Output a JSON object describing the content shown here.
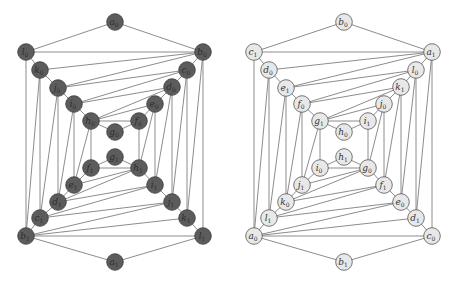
{
  "graphs": [
    {
      "name": "left-graph",
      "style": "dark",
      "colors": {
        "fill": "#5c5c5c",
        "stroke": "#3c3c3c",
        "text": "#2e2e2e"
      },
      "nodes": [
        {
          "id": "a0",
          "letter": "a",
          "sub": "0",
          "x": 115,
          "y": 22
        },
        {
          "id": "l0",
          "letter": "l",
          "sub": "0",
          "x": 26,
          "y": 52
        },
        {
          "id": "b0",
          "letter": "b",
          "sub": "0",
          "x": 203,
          "y": 52
        },
        {
          "id": "k0",
          "letter": "k",
          "sub": "0",
          "x": 40,
          "y": 70
        },
        {
          "id": "c0",
          "letter": "c",
          "sub": "0",
          "x": 187,
          "y": 70
        },
        {
          "id": "j0",
          "letter": "j",
          "sub": "0",
          "x": 58,
          "y": 88
        },
        {
          "id": "d0",
          "letter": "d",
          "sub": "0",
          "x": 172,
          "y": 87
        },
        {
          "id": "i0",
          "letter": "i",
          "sub": "0",
          "x": 74,
          "y": 104
        },
        {
          "id": "e0",
          "letter": "e",
          "sub": "0",
          "x": 155,
          "y": 104
        },
        {
          "id": "h0",
          "letter": "h",
          "sub": "0",
          "x": 91,
          "y": 121
        },
        {
          "id": "f0",
          "letter": "f",
          "sub": "0",
          "x": 139,
          "y": 121
        },
        {
          "id": "g0",
          "letter": "g",
          "sub": "0",
          "x": 115,
          "y": 132
        },
        {
          "id": "g1",
          "letter": "g",
          "sub": "1",
          "x": 115,
          "y": 157
        },
        {
          "id": "f1",
          "letter": "f",
          "sub": "1",
          "x": 91,
          "y": 168
        },
        {
          "id": "h1",
          "letter": "h",
          "sub": "1",
          "x": 139,
          "y": 168
        },
        {
          "id": "e1",
          "letter": "e",
          "sub": "1",
          "x": 74,
          "y": 185
        },
        {
          "id": "i1",
          "letter": "i",
          "sub": "1",
          "x": 155,
          "y": 185
        },
        {
          "id": "d1",
          "letter": "d",
          "sub": "1",
          "x": 58,
          "y": 202
        },
        {
          "id": "j1",
          "letter": "j",
          "sub": "1",
          "x": 172,
          "y": 202
        },
        {
          "id": "c1",
          "letter": "c",
          "sub": "1",
          "x": 40,
          "y": 218
        },
        {
          "id": "k1",
          "letter": "k",
          "sub": "1",
          "x": 187,
          "y": 218
        },
        {
          "id": "b1",
          "letter": "b",
          "sub": "1",
          "x": 26,
          "y": 236
        },
        {
          "id": "l1",
          "letter": "l",
          "sub": "1",
          "x": 203,
          "y": 236
        },
        {
          "id": "a1",
          "letter": "a",
          "sub": "1",
          "x": 115,
          "y": 262
        }
      ],
      "edges": [
        [
          "a0",
          "l0"
        ],
        [
          "a0",
          "b0"
        ],
        [
          "l0",
          "b0"
        ],
        [
          "l0",
          "k0"
        ],
        [
          "k0",
          "j0"
        ],
        [
          "j0",
          "i0"
        ],
        [
          "i0",
          "h0"
        ],
        [
          "h0",
          "g0"
        ],
        [
          "g0",
          "f0"
        ],
        [
          "f0",
          "e0"
        ],
        [
          "e0",
          "d0"
        ],
        [
          "d0",
          "c0"
        ],
        [
          "c0",
          "b0"
        ],
        [
          "b0",
          "k0"
        ],
        [
          "b0",
          "j0"
        ],
        [
          "c0",
          "j0"
        ],
        [
          "c0",
          "i0"
        ],
        [
          "d0",
          "i0"
        ],
        [
          "d0",
          "h0"
        ],
        [
          "e0",
          "h0"
        ],
        [
          "h0",
          "f0"
        ],
        [
          "a1",
          "b1"
        ],
        [
          "a1",
          "l1"
        ],
        [
          "b1",
          "l1"
        ],
        [
          "b1",
          "c1"
        ],
        [
          "c1",
          "d1"
        ],
        [
          "d1",
          "e1"
        ],
        [
          "e1",
          "f1"
        ],
        [
          "f1",
          "g1"
        ],
        [
          "g1",
          "h1"
        ],
        [
          "h1",
          "i1"
        ],
        [
          "i1",
          "j1"
        ],
        [
          "j1",
          "k1"
        ],
        [
          "k1",
          "l1"
        ],
        [
          "b1",
          "k1"
        ],
        [
          "b1",
          "j1"
        ],
        [
          "c1",
          "j1"
        ],
        [
          "c1",
          "i1"
        ],
        [
          "d1",
          "i1"
        ],
        [
          "d1",
          "h1"
        ],
        [
          "e1",
          "h1"
        ],
        [
          "f1",
          "h1"
        ],
        [
          "l0",
          "b1"
        ],
        [
          "k0",
          "b1"
        ],
        [
          "k0",
          "c1"
        ],
        [
          "j0",
          "c1"
        ],
        [
          "j0",
          "d1"
        ],
        [
          "i0",
          "d1"
        ],
        [
          "i0",
          "e1"
        ],
        [
          "h0",
          "e1"
        ],
        [
          "h0",
          "f1"
        ],
        [
          "b0",
          "l1"
        ],
        [
          "b0",
          "k1"
        ],
        [
          "c0",
          "k1"
        ],
        [
          "c0",
          "j1"
        ],
        [
          "d0",
          "j1"
        ],
        [
          "d0",
          "i1"
        ],
        [
          "e0",
          "i1"
        ],
        [
          "e0",
          "h1"
        ],
        [
          "f0",
          "h1"
        ]
      ]
    },
    {
      "name": "right-graph",
      "style": "light",
      "colors": {
        "fill": "#e8e8e8",
        "stroke": "#555555",
        "text": "#333333"
      },
      "nodes": [
        {
          "id": "b0",
          "letter": "b",
          "sub": "0",
          "x": 344,
          "y": 22
        },
        {
          "id": "c1",
          "letter": "c",
          "sub": "1",
          "x": 254,
          "y": 52
        },
        {
          "id": "a1",
          "letter": "a",
          "sub": "1",
          "x": 432,
          "y": 52
        },
        {
          "id": "d0",
          "letter": "d",
          "sub": "0",
          "x": 269,
          "y": 70
        },
        {
          "id": "l0",
          "letter": "l",
          "sub": "0",
          "x": 416,
          "y": 70
        },
        {
          "id": "e1",
          "letter": "e",
          "sub": "1",
          "x": 286,
          "y": 88
        },
        {
          "id": "k1",
          "letter": "k",
          "sub": "1",
          "x": 401,
          "y": 87
        },
        {
          "id": "f0",
          "letter": "f",
          "sub": "0",
          "x": 302,
          "y": 104
        },
        {
          "id": "j0",
          "letter": "j",
          "sub": "0",
          "x": 384,
          "y": 104
        },
        {
          "id": "g1",
          "letter": "g",
          "sub": "1",
          "x": 320,
          "y": 121
        },
        {
          "id": "i1",
          "letter": "i",
          "sub": "1",
          "x": 368,
          "y": 121
        },
        {
          "id": "h0",
          "letter": "h",
          "sub": "0",
          "x": 344,
          "y": 132
        },
        {
          "id": "h1",
          "letter": "h",
          "sub": "1",
          "x": 344,
          "y": 157
        },
        {
          "id": "i0",
          "letter": "i",
          "sub": "0",
          "x": 320,
          "y": 168
        },
        {
          "id": "g0",
          "letter": "g",
          "sub": "0",
          "x": 368,
          "y": 168
        },
        {
          "id": "j1",
          "letter": "j",
          "sub": "1",
          "x": 302,
          "y": 185
        },
        {
          "id": "f1",
          "letter": "f",
          "sub": "1",
          "x": 384,
          "y": 185
        },
        {
          "id": "k0",
          "letter": "k",
          "sub": "0",
          "x": 286,
          "y": 202
        },
        {
          "id": "e0",
          "letter": "e",
          "sub": "0",
          "x": 401,
          "y": 202
        },
        {
          "id": "l1",
          "letter": "l",
          "sub": "1",
          "x": 269,
          "y": 218
        },
        {
          "id": "d1",
          "letter": "d",
          "sub": "1",
          "x": 416,
          "y": 218
        },
        {
          "id": "a0",
          "letter": "a",
          "sub": "0",
          "x": 254,
          "y": 236
        },
        {
          "id": "c0",
          "letter": "c",
          "sub": "0",
          "x": 432,
          "y": 236
        },
        {
          "id": "b1",
          "letter": "b",
          "sub": "1",
          "x": 344,
          "y": 262
        }
      ],
      "edges": [
        [
          "b0",
          "c1"
        ],
        [
          "b0",
          "a1"
        ],
        [
          "c1",
          "a1"
        ],
        [
          "c1",
          "d0"
        ],
        [
          "d0",
          "e1"
        ],
        [
          "e1",
          "f0"
        ],
        [
          "f0",
          "g1"
        ],
        [
          "g1",
          "h0"
        ],
        [
          "h0",
          "i1"
        ],
        [
          "i1",
          "j0"
        ],
        [
          "j0",
          "k1"
        ],
        [
          "k1",
          "l0"
        ],
        [
          "l0",
          "a1"
        ],
        [
          "a1",
          "d0"
        ],
        [
          "a1",
          "e1"
        ],
        [
          "l0",
          "e1"
        ],
        [
          "l0",
          "f0"
        ],
        [
          "k1",
          "f0"
        ],
        [
          "k1",
          "g1"
        ],
        [
          "j0",
          "g1"
        ],
        [
          "g1",
          "i1"
        ],
        [
          "b1",
          "a0"
        ],
        [
          "b1",
          "c0"
        ],
        [
          "a0",
          "c0"
        ],
        [
          "a0",
          "l1"
        ],
        [
          "l1",
          "k0"
        ],
        [
          "k0",
          "j1"
        ],
        [
          "j1",
          "i0"
        ],
        [
          "i0",
          "h1"
        ],
        [
          "h1",
          "g0"
        ],
        [
          "g0",
          "f1"
        ],
        [
          "f1",
          "e0"
        ],
        [
          "e0",
          "d1"
        ],
        [
          "d1",
          "c0"
        ],
        [
          "a0",
          "d1"
        ],
        [
          "a0",
          "e0"
        ],
        [
          "l1",
          "e0"
        ],
        [
          "l1",
          "f1"
        ],
        [
          "k0",
          "f1"
        ],
        [
          "k0",
          "g0"
        ],
        [
          "j1",
          "g0"
        ],
        [
          "i0",
          "g0"
        ],
        [
          "c1",
          "a0"
        ],
        [
          "d0",
          "a0"
        ],
        [
          "d0",
          "l1"
        ],
        [
          "e1",
          "l1"
        ],
        [
          "e1",
          "k0"
        ],
        [
          "f0",
          "k0"
        ],
        [
          "f0",
          "j1"
        ],
        [
          "g1",
          "j1"
        ],
        [
          "g1",
          "i0"
        ],
        [
          "a1",
          "c0"
        ],
        [
          "a1",
          "d1"
        ],
        [
          "l0",
          "d1"
        ],
        [
          "l0",
          "e0"
        ],
        [
          "k1",
          "e0"
        ],
        [
          "k1",
          "f1"
        ],
        [
          "j0",
          "f1"
        ],
        [
          "j0",
          "g0"
        ],
        [
          "i1",
          "g0"
        ]
      ]
    }
  ]
}
